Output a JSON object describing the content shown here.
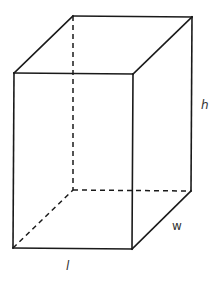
{
  "diagram": {
    "colors": {
      "stroke": "#1a1a1a",
      "label": "#333333",
      "background": "#ffffff"
    },
    "vertices": {
      "front_top_left": [
        14,
        73
      ],
      "front_top_right": [
        133,
        74
      ],
      "front_bottom_left": [
        13,
        248
      ],
      "front_bottom_right": [
        132,
        249
      ],
      "back_top_left": [
        73,
        16
      ],
      "back_top_right": [
        192,
        17
      ],
      "back_bottom_left": [
        73,
        190
      ],
      "back_bottom_right": [
        191,
        191
      ]
    },
    "labels": {
      "height": "h",
      "width": "w",
      "length": "l"
    }
  }
}
